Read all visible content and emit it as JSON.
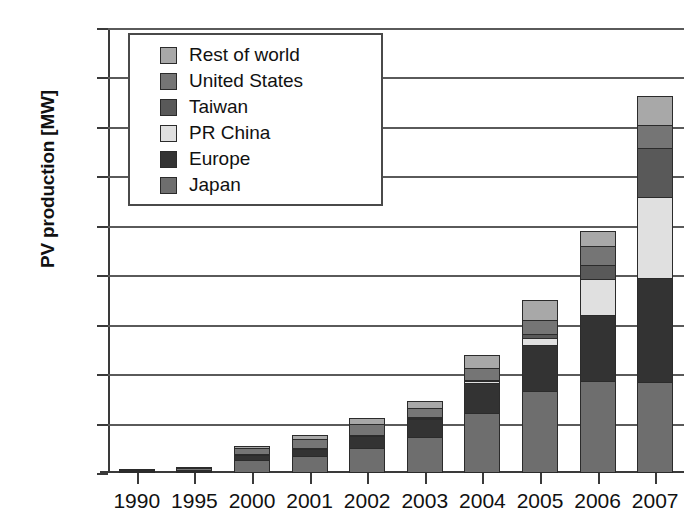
{
  "chart_data": {
    "type": "bar",
    "stacked": true,
    "title": "",
    "xlabel": "",
    "ylabel": "PV production [MW]",
    "ylim": [
      0,
      4500
    ],
    "ytick_values": [
      0,
      500,
      1000,
      1500,
      2000,
      2500,
      3000,
      3500,
      4000,
      4500
    ],
    "ytick_labels": [
      "0",
      "500",
      "1.000",
      "1.500",
      "2.000",
      "2.500",
      "3.000",
      "3.500",
      "4.000",
      "4.500"
    ],
    "grid": true,
    "legend_position": "upper-left-inset",
    "categories": [
      "1990",
      "1995",
      "2000",
      "2001",
      "2002",
      "2003",
      "2004",
      "2005",
      "2006",
      "2007"
    ],
    "series": [
      {
        "name": "Japan",
        "color": "#6e6e6e",
        "values": [
          17,
          16,
          129,
          171,
          251,
          364,
          602,
          833,
          927,
          920
        ]
      },
      {
        "name": "Europe",
        "color": "#333333",
        "values": [
          22,
          20,
          61,
          86,
          135,
          193,
          314,
          470,
          682,
          1060
        ]
      },
      {
        "name": "PR China",
        "color": "#e0e0e0",
        "values": [
          0,
          0,
          3,
          4,
          10,
          14,
          30,
          80,
          370,
          830
        ]
      },
      {
        "name": "Taiwan",
        "color": "#595959",
        "values": [
          0,
          0,
          0,
          0,
          0,
          5,
          10,
          50,
          160,
          510
        ]
      },
      {
        "name": "United States",
        "color": "#757575",
        "values": [
          14,
          35,
          75,
          101,
          121,
          103,
          139,
          154,
          202,
          243
        ]
      },
      {
        "name": "Rest of world",
        "color": "#a8a8a8",
        "values": [
          0,
          5,
          32,
          48,
          66,
          81,
          135,
          213,
          159,
          297
        ]
      }
    ],
    "totals": [
      53,
      76,
      300,
      410,
      583,
      760,
      1230,
      1800,
      2500,
      3860
    ]
  },
  "legend": {
    "entries": [
      {
        "label": "Rest of world",
        "color": "#a8a8a8"
      },
      {
        "label": "United States",
        "color": "#757575"
      },
      {
        "label": "Taiwan",
        "color": "#595959"
      },
      {
        "label": "PR China",
        "color": "#e0e0e0"
      },
      {
        "label": "Europe",
        "color": "#333333"
      },
      {
        "label": "Japan",
        "color": "#6e6e6e"
      }
    ]
  },
  "axis": {
    "y_title": "PV production [MW]"
  }
}
